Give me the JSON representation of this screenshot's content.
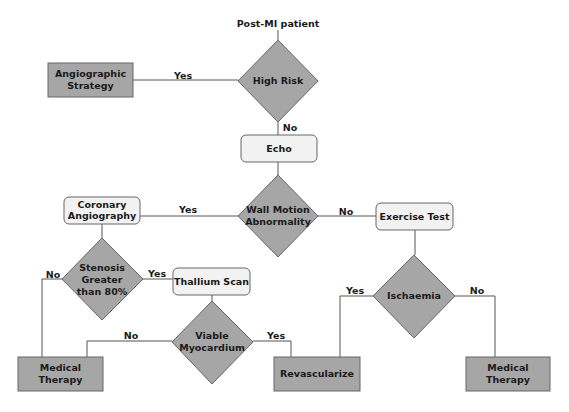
{
  "start": {
    "label": "Post-MI patient"
  },
  "nodes": {
    "high_risk": {
      "type": "decision",
      "lines": [
        "High Risk"
      ]
    },
    "angiographic_strategy": {
      "type": "terminal",
      "lines": [
        "Angiographic",
        "Strategy"
      ]
    },
    "echo": {
      "type": "process",
      "lines": [
        "Echo"
      ]
    },
    "wall_motion": {
      "type": "decision",
      "lines": [
        "Wall Motion",
        "Abnormality"
      ]
    },
    "coronary_angiography": {
      "type": "process",
      "lines": [
        "Coronary",
        "Angiography"
      ]
    },
    "exercise_test": {
      "type": "process",
      "lines": [
        "Exercise Test"
      ]
    },
    "stenosis": {
      "type": "decision",
      "lines": [
        "Stenosis",
        "Greater",
        "than 80%"
      ]
    },
    "thallium_scan": {
      "type": "process",
      "lines": [
        "Thallium Scan"
      ]
    },
    "ischaemia": {
      "type": "decision",
      "lines": [
        "Ischaemia"
      ]
    },
    "viable_myocardium": {
      "type": "decision",
      "lines": [
        "Viable",
        "Myocardium"
      ]
    },
    "medical_therapy_left": {
      "type": "terminal",
      "lines": [
        "Medical",
        "Therapy"
      ]
    },
    "revascularize": {
      "type": "terminal",
      "lines": [
        "Revascularize"
      ]
    },
    "medical_therapy_right": {
      "type": "terminal",
      "lines": [
        "Medical",
        "Therapy"
      ]
    }
  },
  "edges": {
    "high_risk_yes": {
      "from": "high_risk",
      "to": "angiographic_strategy",
      "label": "Yes"
    },
    "high_risk_no": {
      "from": "high_risk",
      "to": "echo",
      "label": "No"
    },
    "echo_to_wall": {
      "from": "echo",
      "to": "wall_motion",
      "label": ""
    },
    "wall_yes": {
      "from": "wall_motion",
      "to": "coronary_angiography",
      "label": "Yes"
    },
    "wall_no": {
      "from": "wall_motion",
      "to": "exercise_test",
      "label": "No"
    },
    "coronary_to_stenosis": {
      "from": "coronary_angiography",
      "to": "stenosis",
      "label": ""
    },
    "stenosis_no": {
      "from": "stenosis",
      "to": "medical_therapy_left",
      "label": "No"
    },
    "stenosis_yes": {
      "from": "stenosis",
      "to": "thallium_scan",
      "label": "Yes"
    },
    "thallium_to_viable": {
      "from": "thallium_scan",
      "to": "viable_myocardium",
      "label": ""
    },
    "viable_no": {
      "from": "viable_myocardium",
      "to": "medical_therapy_left",
      "label": "No"
    },
    "viable_yes": {
      "from": "viable_myocardium",
      "to": "revascularize",
      "label": "Yes"
    },
    "exercise_to_ischaemia": {
      "from": "exercise_test",
      "to": "ischaemia",
      "label": ""
    },
    "ischaemia_yes": {
      "from": "ischaemia",
      "to": "revascularize",
      "label": "Yes"
    },
    "ischaemia_no": {
      "from": "ischaemia",
      "to": "medical_therapy_right",
      "label": "No"
    }
  },
  "colors": {
    "decision_fill": "#a6a6a6",
    "terminal_fill": "#a6a6a6",
    "process_fill": "#f2f2f2",
    "stroke": "#666666",
    "text": "#1a1a1a"
  }
}
